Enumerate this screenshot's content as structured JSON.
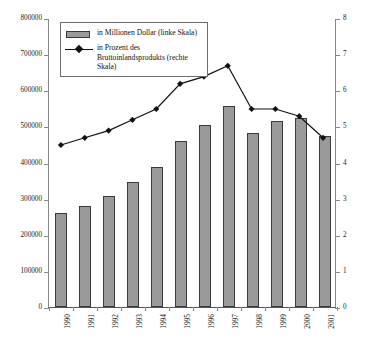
{
  "chart_data": {
    "type": "bar",
    "title": "",
    "subtitle": "",
    "xlabel": "",
    "ylabel": "",
    "y2label": "",
    "grid": false,
    "legend_position": "top-left",
    "categories": [
      "1990",
      "1991",
      "1992",
      "1993",
      "1994",
      "1995",
      "1996",
      "1997",
      "1998",
      "1999",
      "2000",
      "2001"
    ],
    "ylim": [
      0,
      800000
    ],
    "yticks": [
      "0",
      "100000",
      "200000",
      "300000",
      "400000",
      "500000",
      "600000",
      "700000",
      "800000"
    ],
    "ytick_values": [
      0,
      100000,
      200000,
      300000,
      400000,
      500000,
      600000,
      700000,
      800000
    ],
    "y2lim": [
      0,
      8
    ],
    "y2ticks": [
      "0",
      "1",
      "2",
      "3",
      "4",
      "5",
      "6",
      "7",
      "8"
    ],
    "y2tick_values": [
      0,
      1,
      2,
      3,
      4,
      5,
      6,
      7,
      8
    ],
    "series": [
      {
        "name": "in Millionen Dollar (linke Skala)",
        "type": "bar",
        "axis": "left",
        "color": "#9a9a9a",
        "edge_color": "#3a3a3a",
        "values": [
          260000,
          281000,
          308000,
          345000,
          388000,
          459000,
          503000,
          556000,
          482000,
          516000,
          523000,
          474000
        ]
      },
      {
        "name": "in Prozent des Bruttoinlandsprodukts (rechte Skala)",
        "type": "line",
        "axis": "right",
        "color": "#111111",
        "marker": "diamond",
        "values": [
          4.5,
          4.7,
          4.9,
          5.2,
          5.5,
          6.2,
          6.4,
          6.7,
          5.5,
          5.5,
          5.3,
          4.7
        ]
      }
    ]
  },
  "legend": {
    "items": [
      {
        "label": "in Millionen Dollar (linke Skala)",
        "key": "bar-swatch"
      },
      {
        "label": "in Prozent des Bruttoinlandsprodukts (rechte Skala)",
        "key": "line-marker"
      }
    ]
  }
}
